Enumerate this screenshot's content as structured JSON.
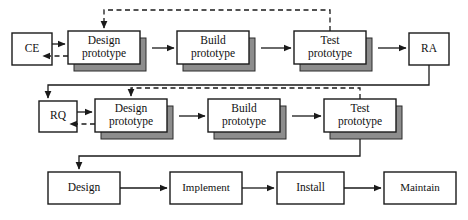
{
  "diagram": {
    "type": "process-flow-diagram",
    "background_color": "#ffffff",
    "line_color": "#1a1a1a",
    "shadow_color": "#8d8d8d",
    "box_fill": "#ffffff",
    "rows": [
      {
        "id": "row-top",
        "nodes": [
          {
            "id": "ce",
            "label": "CE",
            "style": "plain"
          },
          {
            "id": "design-prototype-1",
            "label_line1": "Design",
            "label_line2": "prototype",
            "style": "stacked"
          },
          {
            "id": "build-prototype-1",
            "label_line1": "Build",
            "label_line2": "prototype",
            "style": "stacked"
          },
          {
            "id": "test-prototype-1",
            "label_line1": "Test",
            "label_line2": "prototype",
            "style": "stacked"
          },
          {
            "id": "ra",
            "label": "RA",
            "style": "plain"
          }
        ]
      },
      {
        "id": "row-middle",
        "nodes": [
          {
            "id": "rq",
            "label": "RQ",
            "style": "plain"
          },
          {
            "id": "design-prototype-2",
            "label_line1": "Design",
            "label_line2": "prototype",
            "style": "stacked"
          },
          {
            "id": "build-prototype-2",
            "label_line1": "Build",
            "label_line2": "prototype",
            "style": "stacked"
          },
          {
            "id": "test-prototype-2",
            "label_line1": "Test",
            "label_line2": "prototype",
            "style": "stacked"
          }
        ]
      },
      {
        "id": "row-bottom",
        "nodes": [
          {
            "id": "design",
            "label": "Design",
            "style": "plain"
          },
          {
            "id": "implement",
            "label": "Implement",
            "style": "plain"
          },
          {
            "id": "install",
            "label": "Install",
            "style": "plain"
          },
          {
            "id": "maintain",
            "label": "Maintain",
            "style": "plain"
          }
        ]
      }
    ],
    "edges": [
      {
        "id": "ce-to-design1",
        "from": "ce",
        "to": "design-prototype-1",
        "style": "solid",
        "arrow": true
      },
      {
        "id": "design1-to-ce",
        "from": "design-prototype-1",
        "to": "ce",
        "style": "dashed",
        "arrow": true
      },
      {
        "id": "design1-to-build1",
        "from": "design-prototype-1",
        "to": "build-prototype-1",
        "style": "solid",
        "arrow": true
      },
      {
        "id": "build1-to-test1",
        "from": "build-prototype-1",
        "to": "test-prototype-1",
        "style": "solid",
        "arrow": true
      },
      {
        "id": "test1-to-ra",
        "from": "test-prototype-1",
        "to": "ra",
        "style": "solid",
        "arrow": true
      },
      {
        "id": "test1-feedback-to-design1",
        "from": "test-prototype-1",
        "to": "design-prototype-1",
        "style": "dashed",
        "arrow": true
      },
      {
        "id": "ra-to-rq",
        "from": "ra",
        "to": "rq",
        "style": "solid",
        "arrow": true
      },
      {
        "id": "rq-to-design2",
        "from": "rq",
        "to": "design-prototype-2",
        "style": "solid",
        "arrow": true
      },
      {
        "id": "design2-to-rq",
        "from": "design-prototype-2",
        "to": "rq",
        "style": "dashed",
        "arrow": true
      },
      {
        "id": "design2-to-build2",
        "from": "design-prototype-2",
        "to": "build-prototype-2",
        "style": "solid",
        "arrow": true
      },
      {
        "id": "build2-to-test2",
        "from": "build-prototype-2",
        "to": "test-prototype-2",
        "style": "solid",
        "arrow": true
      },
      {
        "id": "test2-feedback-to-design2",
        "from": "test-prototype-2",
        "to": "design-prototype-2",
        "style": "dashed",
        "arrow": true
      },
      {
        "id": "test2-to-design",
        "from": "test-prototype-2",
        "to": "design",
        "style": "solid",
        "arrow": true
      },
      {
        "id": "design-to-implement",
        "from": "design",
        "to": "implement",
        "style": "solid",
        "arrow": true
      },
      {
        "id": "implement-to-install",
        "from": "implement",
        "to": "install",
        "style": "solid",
        "arrow": true
      },
      {
        "id": "install-to-maintain",
        "from": "install",
        "to": "maintain",
        "style": "solid",
        "arrow": true
      }
    ]
  }
}
